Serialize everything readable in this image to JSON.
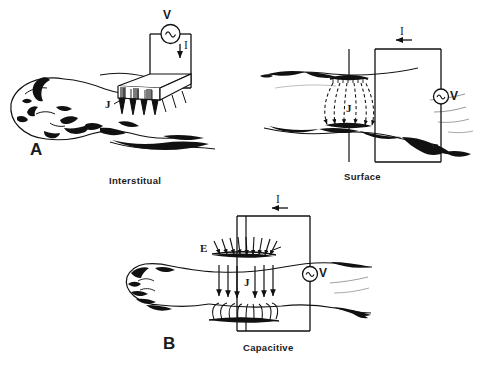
{
  "figure": {
    "background_color": "#ffffff",
    "ink_color": "#111111",
    "title": ""
  },
  "panels": [
    {
      "id": "A",
      "letter": "A",
      "caption": "Interstitual",
      "subject": "head-and-neck-with-needle-electrode-array",
      "symbols": {
        "source": "V",
        "source_type": "ac-voltage-source",
        "current": "I",
        "current_arrow_direction": "down",
        "current_density": "J"
      }
    },
    {
      "id": "A2",
      "letter": "",
      "caption": "Surface",
      "subject": "limb-with-surface-contact-electrodes",
      "symbols": {
        "source": "V",
        "source_type": "ac-voltage-source",
        "current": "I",
        "current_arrow_direction": "left",
        "current_density": "J"
      }
    },
    {
      "id": "B",
      "letter": "B",
      "caption": "Capacitive",
      "subject": "arm-with-capacitive-plate-electrodes",
      "symbols": {
        "source": "V",
        "source_type": "ac-voltage-source",
        "current": "I",
        "current_arrow_direction": "left",
        "field": "E",
        "current_density": "J"
      }
    }
  ]
}
